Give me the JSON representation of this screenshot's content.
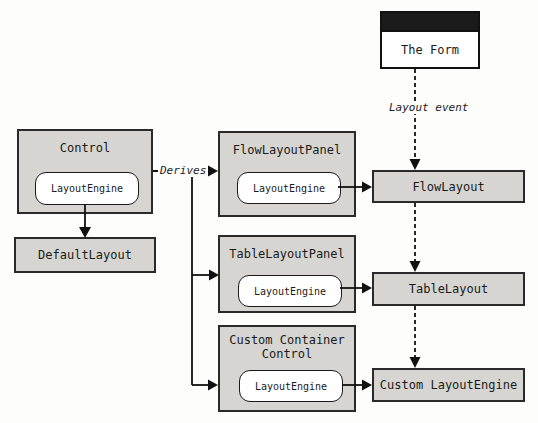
{
  "form": {
    "title": "The Form"
  },
  "labels": {
    "layout_event": "Layout event",
    "derives": "Derives"
  },
  "control": {
    "title": "Control",
    "engine": "LayoutEngine"
  },
  "default_layout": {
    "title": "DefaultLayout"
  },
  "panels": [
    {
      "title": "FlowLayoutPanel",
      "engine": "LayoutEngine"
    },
    {
      "title": "TableLayoutPanel",
      "engine": "LayoutEngine"
    },
    {
      "title": "Custom Container Control",
      "engine": "LayoutEngine"
    }
  ],
  "engines": [
    {
      "label": "FlowLayout"
    },
    {
      "label": "TableLayout"
    },
    {
      "label": "Custom LayoutEngine"
    }
  ],
  "colors": {
    "box_fill": "#d6d5d1",
    "box_border": "#2a2a2a",
    "titlebar": "#1b1b1b",
    "line": "#111111",
    "background": "#fdfdfb"
  }
}
